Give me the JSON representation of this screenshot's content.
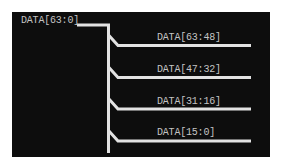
{
  "diagram": {
    "type": "bus-splitter",
    "background_color": "#0d0d0d",
    "line_color": "#e2e2e2",
    "text_color": "#c4c4c4",
    "input_bus": {
      "label": "DATA[63:0]"
    },
    "output_buses": [
      {
        "label": "DATA[63:48]"
      },
      {
        "label": "DATA[47:32]"
      },
      {
        "label": "DATA[31:16]"
      },
      {
        "label": "DATA[15:0]"
      }
    ]
  }
}
